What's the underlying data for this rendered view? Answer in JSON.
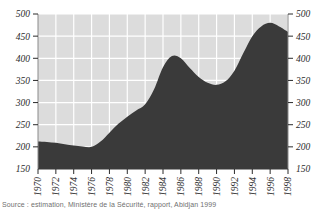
{
  "figure": {
    "background_color": "#ffffff",
    "plot_background_color": "#dcdcdc",
    "grid_color": "#ffffff",
    "area_fill_color": "#3a3a3a",
    "tick_color": "#2b2b2b"
  },
  "source": {
    "caption": "Source : estimation, Ministère de la Sécurité, rapport, Abidjan 1999"
  },
  "chart_data": {
    "type": "area",
    "title": "",
    "subtitle": "",
    "xlabel": "",
    "ylabel": "",
    "xlim": [
      1970,
      1998
    ],
    "ylim": [
      150,
      500
    ],
    "grid": true,
    "legend": null,
    "legend_position": "none",
    "y_axis_duplicated_right": true,
    "x_tick_rotation": 90,
    "yticks": [
      150,
      200,
      250,
      300,
      350,
      400,
      450,
      500
    ],
    "ytick_labels": [
      "150",
      "200",
      "250",
      "300",
      "350",
      "400",
      "450",
      "500"
    ],
    "xticks": [
      1970,
      1972,
      1974,
      1976,
      1978,
      1980,
      1982,
      1984,
      1986,
      1988,
      1990,
      1992,
      1994,
      1996,
      1998
    ],
    "xtick_labels": [
      "1970",
      "1972",
      "1974",
      "1976",
      "1978",
      "1980",
      "1982",
      "1984",
      "1986",
      "1988",
      "1990",
      "1992",
      "1994",
      "1996",
      "1998"
    ],
    "baseline": 150,
    "x": [
      1970,
      1971,
      1972,
      1973,
      1974,
      1975,
      1976,
      1977,
      1978,
      1979,
      1980,
      1981,
      1982,
      1983,
      1984,
      1985,
      1986,
      1987,
      1988,
      1989,
      1990,
      1991,
      1992,
      1993,
      1994,
      1995,
      1996,
      1997,
      1998
    ],
    "values": [
      212,
      211,
      209,
      206,
      203,
      201,
      200,
      212,
      232,
      252,
      268,
      282,
      296,
      330,
      380,
      405,
      400,
      378,
      358,
      345,
      340,
      348,
      372,
      412,
      450,
      472,
      480,
      472,
      460
    ],
    "series": [
      {
        "name": "Effectif",
        "values": [
          212,
          211,
          209,
          206,
          203,
          201,
          200,
          212,
          232,
          252,
          268,
          282,
          296,
          330,
          380,
          405,
          400,
          378,
          358,
          345,
          340,
          348,
          372,
          412,
          450,
          472,
          480,
          472,
          460
        ]
      }
    ],
    "annotations": [
      {
        "label": "minimum",
        "x": 1976,
        "y": 200
      },
      {
        "label": "first peak",
        "x": 1985,
        "y": 405
      },
      {
        "label": "trough",
        "x": 1990,
        "y": 340
      },
      {
        "label": "maximum",
        "x": 1996,
        "y": 480
      }
    ]
  }
}
